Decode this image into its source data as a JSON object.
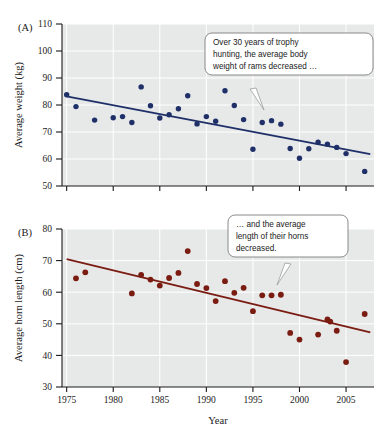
{
  "figure": {
    "xlabel": "Year",
    "panels": [
      {
        "id": "A",
        "label": "(A)",
        "ylabel": "Average weight (kg)",
        "callout": {
          "lines": [
            "Over 30 years of trophy",
            "hunting, the average body",
            "weight of rams decreased …"
          ]
        }
      },
      {
        "id": "B",
        "label": "(B)",
        "ylabel": "Average horn length (cm)",
        "callout": {
          "lines": [
            "… and the average",
            "length of their horns",
            "decreased."
          ]
        }
      }
    ]
  },
  "chart_data": [
    {
      "type": "scatter",
      "panel": "A",
      "title": "",
      "xlabel": "Year",
      "ylabel": "Average weight (kg)",
      "xlim": [
        1974.5,
        2008
      ],
      "ylim": [
        50,
        110
      ],
      "yticks": [
        50,
        60,
        70,
        80,
        90,
        100,
        110
      ],
      "xticks": [
        1975,
        1980,
        1985,
        1990,
        1995,
        2000,
        2005
      ],
      "grid": true,
      "point_color": "#1f3069",
      "line_color": "#1f3069",
      "x": [
        1975,
        1976,
        1978,
        1980,
        1981,
        1982,
        1983,
        1984,
        1985,
        1986,
        1987,
        1988,
        1989,
        1990,
        1991,
        1992,
        1993,
        1994,
        1995,
        1996,
        1997,
        1998,
        1999,
        2000,
        2001,
        2002,
        2003,
        2004,
        2005,
        2007
      ],
      "y": [
        83.8,
        79.4,
        74.4,
        75.3,
        75.7,
        73.5,
        86.7,
        79.7,
        75.2,
        76.4,
        78.6,
        83.4,
        73.0,
        75.7,
        74.0,
        85.3,
        79.8,
        74.6,
        63.6,
        73.5,
        74.2,
        72.9,
        63.9,
        60.3,
        63.8,
        66.2,
        65.5,
        64.3,
        62.0,
        55.4
      ],
      "trendline": {
        "x": [
          1975,
          2007.6
        ],
        "y": [
          83.2,
          61.8
        ]
      }
    },
    {
      "type": "scatter",
      "panel": "B",
      "title": "",
      "xlabel": "Year",
      "ylabel": "Average horn length (cm)",
      "xlim": [
        1974.5,
        2008
      ],
      "ylim": [
        30,
        80
      ],
      "yticks": [
        30,
        40,
        50,
        60,
        70,
        80
      ],
      "xticks": [
        1975,
        1980,
        1985,
        1990,
        1995,
        2000,
        2005
      ],
      "grid": true,
      "point_color": "#7a1c12",
      "line_color": "#7a1c12",
      "x": [
        1976,
        1977,
        1982,
        1983,
        1984,
        1985,
        1986,
        1987,
        1988,
        1989,
        1990,
        1991,
        1992,
        1993,
        1994,
        1995,
        1996,
        1997,
        1998,
        1999,
        2000,
        2002,
        2003,
        2003.3,
        2004,
        2005,
        2007
      ],
      "y": [
        64.4,
        66.3,
        59.6,
        65.5,
        64.0,
        62.1,
        64.5,
        66.1,
        73.0,
        62.6,
        61.3,
        57.2,
        63.5,
        59.8,
        61.4,
        54.0,
        59.0,
        59.0,
        59.2,
        47.1,
        45.0,
        46.6,
        51.4,
        50.7,
        47.8,
        37.9,
        53.1
      ],
      "trendline": {
        "x": [
          1975,
          2007.6
        ],
        "y": [
          70.5,
          47.3
        ]
      }
    }
  ]
}
